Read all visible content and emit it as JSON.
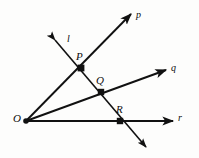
{
  "figure": {
    "type": "geometry-diagram",
    "background_color": "#fdfdfc",
    "stroke_color": "#111111",
    "canvas": {
      "width": 199,
      "height": 158
    }
  },
  "points": [
    {
      "id": "O",
      "label": "O",
      "x": 26,
      "y": 121,
      "label_x": 13,
      "label_y": 114,
      "marker": "dot"
    },
    {
      "id": "P",
      "label": "P",
      "x": 81,
      "y": 68,
      "label_x": 76,
      "label_y": 52,
      "marker": "square"
    },
    {
      "id": "Q",
      "label": "Q",
      "x": 101,
      "y": 92,
      "label_x": 96,
      "label_y": 76,
      "marker": "square"
    },
    {
      "id": "R",
      "label": "R",
      "x": 120,
      "y": 121,
      "label_x": 116,
      "label_y": 105,
      "marker": "square"
    }
  ],
  "rays": [
    {
      "id": "p",
      "label": "p",
      "from_x": 26,
      "from_y": 121,
      "to_x": 131,
      "to_y": 14,
      "label_x": 136,
      "label_y": 11
    },
    {
      "id": "q",
      "label": "q",
      "from_x": 26,
      "from_y": 121,
      "to_x": 166,
      "to_y": 70,
      "label_x": 171,
      "label_y": 64
    },
    {
      "id": "r",
      "label": "r",
      "from_x": 26,
      "from_y": 121,
      "to_x": 173,
      "to_y": 121,
      "label_x": 178,
      "label_y": 114
    }
  ],
  "lines": [
    {
      "id": "l",
      "label": "l",
      "from_x": 54,
      "from_y": 39,
      "to_x": 147,
      "to_y": 148,
      "label_x": 67,
      "label_y": 36,
      "arrows": "both"
    }
  ]
}
